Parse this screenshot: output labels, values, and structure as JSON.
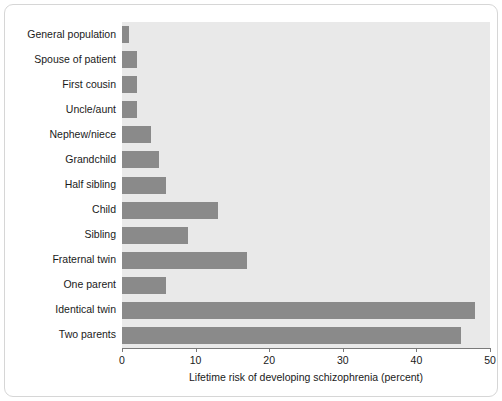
{
  "chart_data": {
    "type": "bar",
    "orientation": "horizontal",
    "title": "",
    "xlabel": "Lifetime risk of developing schizophrenia (percent)",
    "ylabel": "",
    "xlim": [
      0,
      50
    ],
    "xticks": [
      0,
      10,
      20,
      30,
      40,
      50
    ],
    "xtick_labels": [
      "0",
      "10",
      "20",
      "30",
      "40",
      "50"
    ],
    "grid": false,
    "legend": null,
    "bar_color": "#8a8a8a",
    "plot_background": "#e9e9e9",
    "categories": [
      "General population",
      "Spouse of patient",
      "First cousin",
      "Uncle/aunt",
      "Nephew/niece",
      "Grandchild",
      "Half sibling",
      "Child",
      "Sibling",
      "Fraternal twin",
      "One parent",
      "Identical twin",
      "Two parents"
    ],
    "values": [
      1,
      2,
      2,
      2,
      4,
      5,
      6,
      13,
      9,
      17,
      6,
      48,
      46
    ]
  }
}
